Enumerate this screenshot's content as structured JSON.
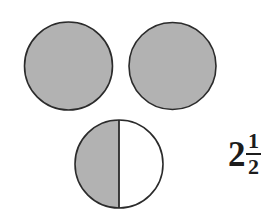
{
  "figure": {
    "background_color": "#ffffff",
    "shape_fill_color": "#b2b2b2",
    "shape_stroke_color": "#2b2b2b",
    "unshaded_fill_color": "#ffffff",
    "shapes": [
      {
        "name": "circle-whole-1",
        "cx": 68.5,
        "cy": 66,
        "r": 44,
        "shaded_fraction": "1",
        "label": "whole circle one"
      },
      {
        "name": "circle-whole-2",
        "cx": 172.5,
        "cy": 66,
        "r": 43.5,
        "shaded_fraction": "1",
        "label": "whole circle two"
      },
      {
        "name": "circle-half",
        "cx": 119,
        "cy": 164,
        "r": 44,
        "shaded_fraction": "1/2",
        "label": "circle shaded one half",
        "divider_orientation": "vertical",
        "shaded_side": "left"
      }
    ]
  },
  "answer": {
    "name": "mixed-number",
    "whole": "2",
    "numerator": "1",
    "denominator": "2",
    "text": "2 1/2"
  }
}
